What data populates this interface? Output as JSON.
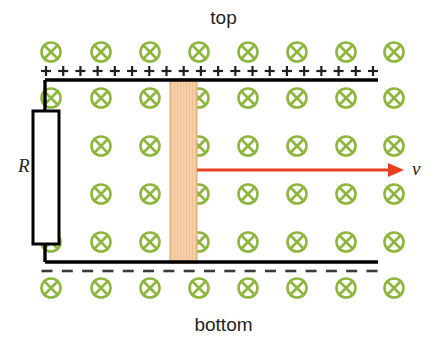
{
  "figure": {
    "title_top": "top",
    "title_bottom": "bottom",
    "resistor_label": "R",
    "velocity_label": "v",
    "plus_sign": "+",
    "minus_sign": "–",
    "field_symbol": "⊗",
    "field_symbol_name": "magnetic-field-into-page-icon",
    "plus_count": 20,
    "minus_count": 17,
    "field_columns": 8,
    "field_rows": 6
  },
  "colors": {
    "field_green": "#8cb63c",
    "field_green_fill": "#ffffff",
    "wire_black": "#000000",
    "rod_fill": "#f5cfa8",
    "rod_stroke": "#e3a972",
    "arrow_red": "#e8401f",
    "text_black": "#231f20",
    "dash_gray": "#3a3a3a"
  },
  "geometry": {
    "top_rail_y": 80,
    "bottom_rail_y": 262,
    "rail_left_x": 45,
    "rail_right_x": 378,
    "rod_x": 170,
    "rod_width": 27,
    "resistor_x": 33,
    "resistor_y": 111,
    "resistor_width": 26,
    "resistor_height": 133,
    "arrow_y": 170,
    "arrow_start_x": 197,
    "arrow_end_x": 404,
    "field_col_x": [
      51,
      101,
      150,
      199,
      248,
      297,
      346,
      394
    ],
    "field_row_y": [
      52,
      98,
      146,
      194,
      242,
      288
    ],
    "plus_row_y": 71,
    "minus_row_y": 271
  }
}
